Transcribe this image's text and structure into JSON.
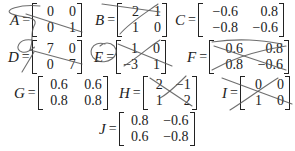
{
  "matrices": {
    "A": {
      "name": "A",
      "eq": "=",
      "rows": [
        [
          "0",
          "0"
        ],
        [
          "0",
          "1"
        ]
      ],
      "crossed_out": true
    },
    "B": {
      "name": "B",
      "eq": "=",
      "rows": [
        [
          "2",
          "1"
        ],
        [
          "1",
          "0"
        ]
      ],
      "crossed_out": true
    },
    "C": {
      "name": "C",
      "eq": "=",
      "rows": [
        [
          "−0.6",
          "0.8"
        ],
        [
          "−0.8",
          "−0.6"
        ]
      ],
      "crossed_out": false
    },
    "D": {
      "name": "D",
      "eq": "=",
      "rows": [
        [
          "7",
          "0"
        ],
        [
          "0",
          "7"
        ]
      ],
      "crossed_out": true
    },
    "E": {
      "name": "E",
      "eq": "=",
      "rows": [
        [
          "1",
          "0"
        ],
        [
          "−3",
          "1"
        ]
      ],
      "crossed_out": true
    },
    "F": {
      "name": "F",
      "eq": "=",
      "rows": [
        [
          "0.6",
          "0.8"
        ],
        [
          "0.8",
          "−0.6"
        ]
      ],
      "crossed_out": true
    },
    "G": {
      "name": "G",
      "eq": "=",
      "rows": [
        [
          "0.6",
          "0.6"
        ],
        [
          "0.8",
          "0.8"
        ]
      ],
      "crossed_out": false
    },
    "H": {
      "name": "H",
      "eq": "=",
      "rows": [
        [
          "2",
          "−1"
        ],
        [
          "1",
          "2"
        ]
      ],
      "crossed_out": true
    },
    "I": {
      "name": "I",
      "eq": "=",
      "rows": [
        [
          "0",
          "0"
        ],
        [
          "1",
          "0"
        ]
      ],
      "crossed_out": true
    },
    "J": {
      "name": "J",
      "eq": "=",
      "rows": [
        [
          "0.8",
          "−0.6"
        ],
        [
          "0.6",
          "−0.8"
        ]
      ],
      "crossed_out": false
    }
  },
  "colors": {
    "ink": "#222222",
    "pen": "#555555",
    "background": "#ffffff"
  }
}
